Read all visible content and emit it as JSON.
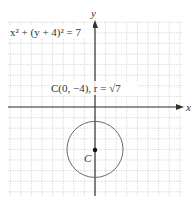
{
  "chart_data": {
    "type": "scatter",
    "title": "",
    "xlabel": "x",
    "ylabel": "y",
    "xlim": [
      -8,
      8
    ],
    "ylim": [
      -8,
      8
    ],
    "grid": true,
    "equation_label": "x² + (y + 4)² = 7",
    "center_label": "C(0, −4), r = √7",
    "center_point_label": "C",
    "circle": {
      "center": [
        0,
        -4
      ],
      "radius": 2.6458
    },
    "points": [
      {
        "name": "C",
        "x": 0,
        "y": -4
      }
    ]
  },
  "colors": {
    "grid": "#bdbdbd",
    "axis": "#333333",
    "circle": "#6b6b6b",
    "point": "#111111"
  }
}
